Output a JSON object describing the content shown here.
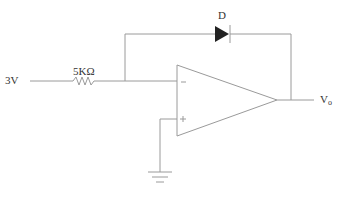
{
  "diagram": {
    "type": "op-amp circuit",
    "input_voltage_label": "3V",
    "resistor_label": "5KΩ",
    "diode_label": "D",
    "output_label": "V",
    "output_subscript": "o",
    "opamp_inverting_symbol": "−",
    "opamp_noninverting_symbol": "+",
    "colors": {
      "wire": "#9a9a9a",
      "diode": "#222222",
      "text": "#333333"
    }
  }
}
